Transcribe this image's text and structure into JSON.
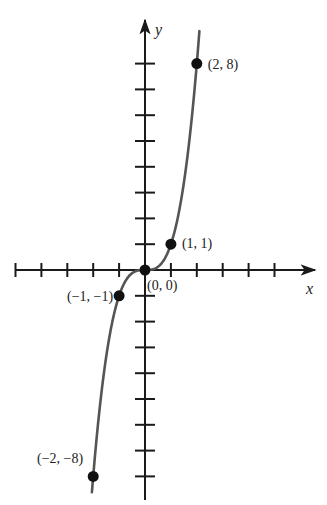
{
  "chart_data": {
    "type": "line",
    "title": "",
    "function": "y = x^3",
    "xlabel": "x",
    "ylabel": "y",
    "xlim": [
      -5,
      6
    ],
    "ylim": [
      -9,
      9
    ],
    "x_ticks": [
      -5,
      -4,
      -3,
      -2,
      -1,
      1,
      2,
      3,
      4,
      5
    ],
    "y_ticks": [
      -8,
      -7,
      -6,
      -5,
      -4,
      -3,
      -2,
      -1,
      1,
      2,
      3,
      4,
      5,
      6,
      7,
      8
    ],
    "grid": false,
    "legend": null,
    "series": [
      {
        "name": "y = x^3",
        "x": [
          -2.05,
          -2,
          -1.5,
          -1,
          -0.5,
          0,
          0.5,
          1,
          1.5,
          2,
          2.1
        ],
        "y": [
          -8.62,
          -8,
          -3.375,
          -1,
          -0.125,
          0,
          0.125,
          1,
          3.375,
          8,
          9.26
        ]
      }
    ],
    "points": [
      {
        "x": 2,
        "y": 8,
        "label": "(2, 8)"
      },
      {
        "x": 1,
        "y": 1,
        "label": "(1, 1)"
      },
      {
        "x": 0,
        "y": 0,
        "label": "(0, 0)"
      },
      {
        "x": -1,
        "y": -1,
        "label": "(−1, −1)"
      },
      {
        "x": -2,
        "y": -8,
        "label": "(−2, −8)"
      }
    ]
  },
  "colors": {
    "axis": "#1a1a1a",
    "curve": "#555555",
    "point": "#111111",
    "text": "#222222"
  }
}
